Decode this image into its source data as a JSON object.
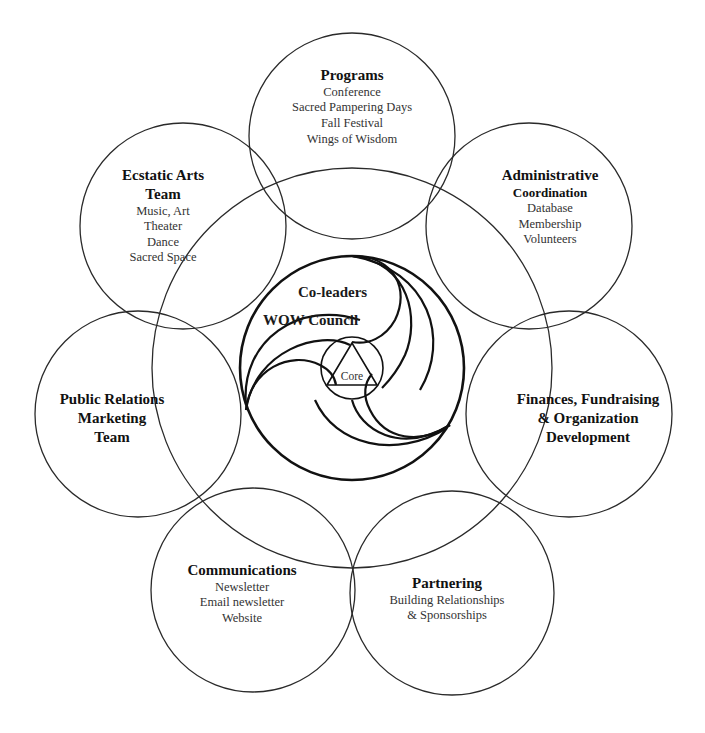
{
  "diagram": {
    "type": "concentric-venn-organization-chart",
    "colors": {
      "line": "#222222",
      "text": "#1a1a1a",
      "background": "#ffffff"
    },
    "center": {
      "labels": [
        "Co-leaders",
        "WOW Council"
      ],
      "core_label": "Core"
    },
    "circles": [
      {
        "id": "programs",
        "title": "Programs",
        "items": [
          "Conference",
          "Sacred Pampering Days",
          "Fall Festival",
          "Wings of Wisdom"
        ]
      },
      {
        "id": "ecstatic-arts",
        "title": "Ecstatic Arts",
        "title2": "Team",
        "items": [
          "Music, Art",
          "Theater",
          "Dance",
          "Sacred Space"
        ]
      },
      {
        "id": "administrative",
        "title": "Administrative",
        "title2": "Coordination",
        "items": [
          "Database",
          "Membership",
          "Volunteers"
        ]
      },
      {
        "id": "public-relations",
        "title": "Public Relations",
        "title2": "Marketing",
        "title3": "Team",
        "items": []
      },
      {
        "id": "finances",
        "title": "Finances, Fundraising",
        "title2": "& Organization",
        "title3": "Development",
        "items": []
      },
      {
        "id": "communications",
        "title": "Communications",
        "items": [
          "Newsletter",
          "Email newsletter",
          "Website"
        ]
      },
      {
        "id": "partnering",
        "title": "Partnering",
        "items": [
          "Building Relationships",
          "& Sponsorships"
        ]
      }
    ]
  }
}
